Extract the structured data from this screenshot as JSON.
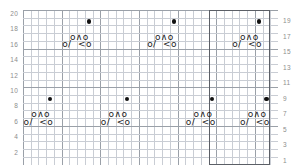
{
  "chart_data": {
    "type": "table",
    "title": "",
    "xlabel": "",
    "ylabel": "",
    "grid": {
      "on": true,
      "columns": 33,
      "rows": 20,
      "cell_px": 7.73,
      "major_every": 5,
      "minor_color": "#c9cdd4",
      "major_color": "#9aa0a8"
    },
    "axes": {
      "left_ticks": [
        "20",
        "18",
        "16",
        "14",
        "12",
        "10",
        "8",
        "6",
        "4",
        "2"
      ],
      "right_ticks": [
        "19",
        "17",
        "15",
        "13",
        "11",
        "9",
        "7",
        "5",
        "3",
        "1"
      ],
      "left_rows": [
        20,
        18,
        16,
        14,
        12,
        10,
        8,
        6,
        4,
        2
      ],
      "right_rows": [
        19,
        17,
        15,
        13,
        11,
        9,
        7,
        5,
        3,
        1
      ],
      "tick_color": "#8d8d8d"
    },
    "repeat_box": {
      "label": "pattern-repeat",
      "col_start": 24,
      "col_span": 8,
      "row_top": 20,
      "row_bottom": 1,
      "color": "#5b5f66"
    },
    "motifs": [
      {
        "name": "motif-top-1",
        "dot_col": 8,
        "dot_row": 19,
        "yo_col": 6,
        "yo_row": 17,
        "dec_col": 5,
        "dec_row": 16
      },
      {
        "name": "motif-top-2",
        "dot_col": 19,
        "dot_row": 19,
        "yo_col": 17,
        "yo_row": 17,
        "dec_col": 16,
        "dec_row": 16
      },
      {
        "name": "motif-top-3",
        "dot_col": 30,
        "dot_row": 19,
        "yo_col": 28,
        "yo_row": 17,
        "dec_col": 27,
        "dec_row": 16
      },
      {
        "name": "motif-bot-1",
        "dot_col": 3,
        "dot_row": 9,
        "yo_col": 1,
        "yo_row": 7,
        "dec_col": 0,
        "dec_row": 6
      },
      {
        "name": "motif-bot-2",
        "dot_col": 13,
        "dot_row": 9,
        "yo_col": 11,
        "yo_row": 7,
        "dec_col": 10,
        "dec_row": 6
      },
      {
        "name": "motif-bot-3",
        "dot_col": 24,
        "dot_row": 9,
        "yo_col": 22,
        "yo_row": 7,
        "dec_col": 21,
        "dec_row": 6
      },
      {
        "name": "motif-bot-4",
        "dot_col": 31,
        "dot_row": 9,
        "yo_col": 29,
        "yo_row": 7,
        "dec_col": 28,
        "dec_row": 6
      }
    ],
    "symbols": {
      "dot": "●",
      "yarn_over_center_decrease": "o∧o",
      "decrease_row": "o/  <o",
      "dot_name": "purl-dot",
      "yo_name": "yarnover-centered-double-decrease",
      "dec_name": "yarnover-left-right-decrease"
    }
  }
}
